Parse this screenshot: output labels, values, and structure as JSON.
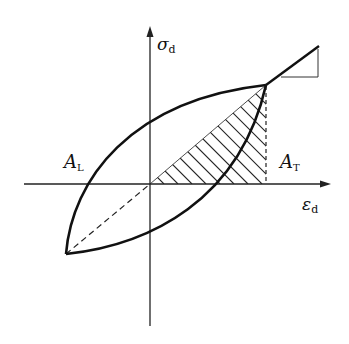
{
  "diagram": {
    "type": "hysteresis-loop",
    "axes": {
      "y_label": "σ",
      "y_label_sub": "d",
      "x_label": "ε",
      "x_label_sub": "d"
    },
    "regions": {
      "loop_area_label": "A",
      "loop_area_sub": "L",
      "triangle_area_label": "A",
      "triangle_area_sub": "T"
    },
    "colors": {
      "stroke": "#111111",
      "background": "#ffffff"
    }
  }
}
